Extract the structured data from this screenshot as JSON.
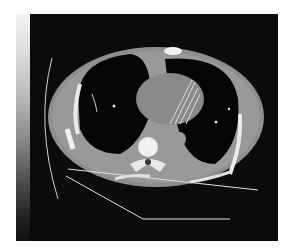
{
  "image": {
    "subject": "axial chest CT slice",
    "colors": {
      "background": "#0b0b0b",
      "soft_tissue": "#9a9a9a",
      "bone": "#f0f0f0",
      "lung": "#050505",
      "page": "#ffffff"
    }
  }
}
